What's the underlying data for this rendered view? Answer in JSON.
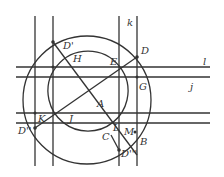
{
  "diagram": {
    "labels": {
      "k": "k",
      "l": "l",
      "j": "j",
      "D": "D",
      "Dprime": "D'",
      "Ddprime": "D''",
      "Dtprime": "D'''",
      "H": "H",
      "E": "E",
      "G": "G",
      "A": "A",
      "K": "K",
      "J": "J",
      "C": "C",
      "L": "L",
      "M": "M",
      "B": "B"
    },
    "colors": {
      "stroke": "#333333",
      "background": "#ffffff"
    }
  }
}
